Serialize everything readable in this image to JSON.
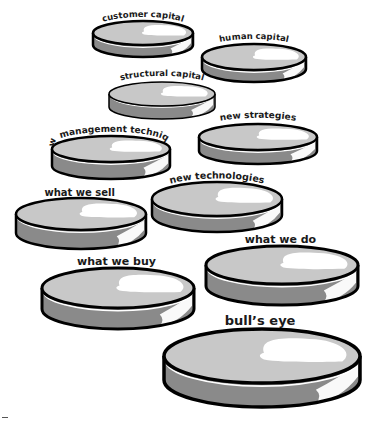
{
  "diagram": {
    "type": "stacked-disks",
    "colors": {
      "background": "#ffffff",
      "outline": "#000000",
      "top_face": "#c8c8c8",
      "top_highlight": "#ffffff",
      "side_face": "#8a8a8a",
      "side_highlight": "#ffffff",
      "label": "#1a1a1a"
    },
    "disks": [
      {
        "id": "customer-capital",
        "label": "customer capital",
        "cx": 143,
        "cy": 33,
        "rx": 50,
        "ry": 12,
        "depth": 12,
        "stroke": 2.5,
        "label_y": 18,
        "font_size": 8.5,
        "arched": true
      },
      {
        "id": "human-capital",
        "label": "human  capital",
        "cx": 254,
        "cy": 57,
        "rx": 52,
        "ry": 13,
        "depth": 12,
        "stroke": 2.5,
        "label_y": 40,
        "font_size": 8.5,
        "arched": true
      },
      {
        "id": "structural-capital",
        "label": "structural capital",
        "cx": 162,
        "cy": 94,
        "rx": 53,
        "ry": 12,
        "depth": 13,
        "stroke": 1.5,
        "label_y": 77,
        "font_size": 8.5,
        "arched": true
      },
      {
        "id": "new-strategies",
        "label": "new strategies",
        "cx": 258,
        "cy": 137,
        "rx": 59,
        "ry": 13,
        "depth": 14,
        "stroke": 2.5,
        "label_y": 119,
        "font_size": 9,
        "arched": true
      },
      {
        "id": "new-management-techniques",
        "label": "new management techniques",
        "cx": 111,
        "cy": 149,
        "rx": 59,
        "ry": 13,
        "depth": 17,
        "stroke": 2.5,
        "label_y": 133,
        "font_size": 9,
        "arched": true
      },
      {
        "id": "new-technologies",
        "label": "new technologies",
        "cx": 217,
        "cy": 199,
        "rx": 65,
        "ry": 17,
        "depth": 16,
        "stroke": 2.5,
        "label_y": 180,
        "font_size": 9.5,
        "arched": true
      },
      {
        "id": "what-we-sell",
        "label": "what we sell",
        "cx": 81,
        "cy": 214,
        "rx": 65,
        "ry": 16,
        "depth": 19,
        "stroke": 2.5,
        "label_y": 196,
        "font_size": 10,
        "arched": false
      },
      {
        "id": "what-we-do",
        "label": "what we do",
        "cx": 282,
        "cy": 265,
        "rx": 76,
        "ry": 19,
        "depth": 21,
        "stroke": 3,
        "label_y": 243,
        "font_size": 11,
        "arched": false
      },
      {
        "id": "what-we-buy",
        "label": "what we buy",
        "cx": 118,
        "cy": 288,
        "rx": 76,
        "ry": 20,
        "depth": 21,
        "stroke": 3,
        "label_y": 265,
        "font_size": 11,
        "arched": false
      },
      {
        "id": "bulls-eye",
        "label": "bull’s eye",
        "cx": 262,
        "cy": 356,
        "rx": 98,
        "ry": 27,
        "depth": 24,
        "stroke": 3.5,
        "label_y": 325,
        "font_size": 13,
        "arched": false
      }
    ]
  }
}
